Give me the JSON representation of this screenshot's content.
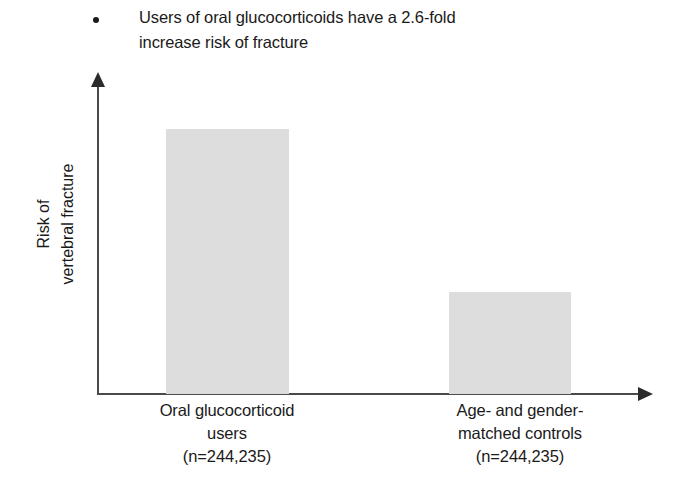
{
  "header": {
    "bullet_text": "Users of oral glucocorticoids have a 2.6-fold\nincrease risk of fracture"
  },
  "chart_data": {
    "type": "bar",
    "title": "",
    "categories": [
      "Oral glucocorticoid\nusers\n(n=244,235)",
      "Age- and gender-\nmatched controls\n(n=244,235)"
    ],
    "category_names": [
      "Oral glucocorticoid users",
      "Age- and gender-matched controls"
    ],
    "sample_sizes": [
      "(n=244,235)",
      "(n=244,235)"
    ],
    "values": [
      2.6,
      1.0
    ],
    "value_unit": "relative risk (fold)",
    "xlabel": "",
    "ylabel": "Risk of\nvertebral fracture",
    "ylim": [
      0,
      3.05
    ],
    "grid": false,
    "legend": false,
    "axis_ticks_shown": false,
    "bar_color": "#dddddd",
    "axis_color": "#4a4a4a",
    "text_color": "#1a1a1a",
    "background_color": "#ffffff"
  }
}
